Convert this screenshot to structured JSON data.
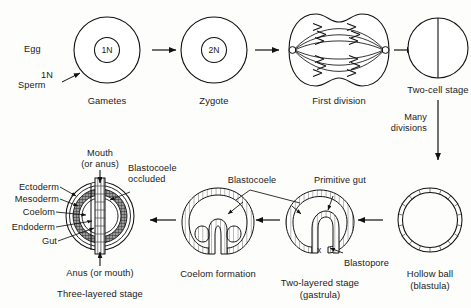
{
  "figure": {
    "ink_color": "#111111",
    "background": "#fdfdfb",
    "shading_color": "#8c8c8c"
  },
  "top_row": {
    "gametes": {
      "caption": "Gametes",
      "egg_label": "Egg",
      "sperm_label": "Sperm",
      "sperm_ploidy": "1N",
      "nucleus": "1N"
    },
    "zygote": {
      "caption": "Zygote",
      "nucleus": "2N"
    },
    "first_division": {
      "caption": "First division"
    },
    "two_cell": {
      "caption": "Two-cell stage"
    }
  },
  "transition": {
    "line1": "Many",
    "line2": "divisions"
  },
  "bottom_row": {
    "blastula": {
      "caption_line1": "Hollow ball",
      "caption_line2": "(blastula)"
    },
    "gastrula": {
      "caption_line1": "Two-layered stage",
      "caption_line2": "(gastrula)",
      "blastocoele_label": "Blastocoele",
      "primitive_gut_label": "Primitive gut",
      "blastopore_label": "Blastopore",
      "blastopore_mark": "x"
    },
    "coelom": {
      "caption": "Coelom formation"
    },
    "three_layered": {
      "caption": "Three-layered stage",
      "mouth_line1": "Mouth",
      "mouth_line2": "(or anus)",
      "anus_label": "Anus (or mouth)",
      "occluded_line1": "Blastocoele",
      "occluded_line2": "occluded",
      "layers": [
        "Ectoderm",
        "Mesoderm",
        "Coelom",
        "Endoderm",
        "Gut"
      ]
    }
  }
}
